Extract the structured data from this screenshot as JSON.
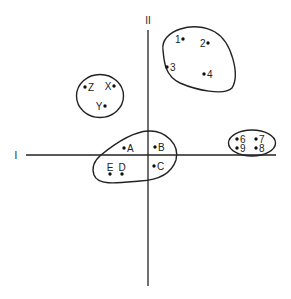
{
  "axes": {
    "horizontal_label": "I",
    "vertical_label": "II"
  },
  "clusters": [
    {
      "name": "cluster-numbers-upper",
      "points": [
        {
          "label": "1",
          "x": 183,
          "y": 39,
          "side": "left"
        },
        {
          "label": "2",
          "x": 208,
          "y": 43,
          "side": "left"
        },
        {
          "label": "3",
          "x": 167,
          "y": 67,
          "side": "right"
        },
        {
          "label": "4",
          "x": 204,
          "y": 74,
          "side": "right"
        }
      ]
    },
    {
      "name": "cluster-xyz",
      "points": [
        {
          "label": "Z",
          "x": 85,
          "y": 87,
          "side": "right"
        },
        {
          "label": "X",
          "x": 114,
          "y": 86,
          "side": "left"
        },
        {
          "label": "Y",
          "x": 105,
          "y": 106,
          "side": "left"
        }
      ]
    },
    {
      "name": "cluster-letters-center",
      "points": [
        {
          "label": "A",
          "x": 124,
          "y": 148,
          "side": "right"
        },
        {
          "label": "B",
          "x": 155,
          "y": 147,
          "side": "right"
        },
        {
          "label": "C",
          "x": 154,
          "y": 166,
          "side": "right"
        },
        {
          "label": "D",
          "x": 122,
          "y": 174,
          "side": "above"
        },
        {
          "label": "E",
          "x": 110,
          "y": 174,
          "side": "above"
        }
      ]
    },
    {
      "name": "cluster-numbers-right",
      "points": [
        {
          "label": "6",
          "x": 237,
          "y": 139,
          "side": "right"
        },
        {
          "label": "7",
          "x": 256,
          "y": 139,
          "side": "right"
        },
        {
          "label": "9",
          "x": 237,
          "y": 148,
          "side": "right"
        },
        {
          "label": "8",
          "x": 256,
          "y": 148,
          "side": "right"
        }
      ]
    }
  ]
}
